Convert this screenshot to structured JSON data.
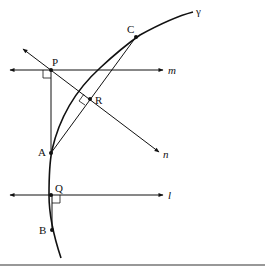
{
  "diagram": {
    "type": "geometry-figure",
    "curve": {
      "name": "gamma",
      "label": "γ"
    },
    "points": [
      {
        "id": "P",
        "label": "P",
        "x": 51,
        "y": 70
      },
      {
        "id": "C",
        "label": "C",
        "x": 136,
        "y": 37
      },
      {
        "id": "R",
        "label": "R",
        "x": 90,
        "y": 99
      },
      {
        "id": "A",
        "label": "A",
        "x": 51,
        "y": 153
      },
      {
        "id": "Q",
        "label": "Q",
        "x": 51,
        "y": 195
      },
      {
        "id": "B",
        "label": "B",
        "x": 52,
        "y": 230
      }
    ],
    "lines": [
      {
        "id": "m",
        "label": "m",
        "description": "horizontal line through P"
      },
      {
        "id": "l",
        "label": "l",
        "description": "horizontal line through Q"
      },
      {
        "id": "n",
        "label": "n",
        "description": "line through P and R perpendicular to AC"
      }
    ],
    "segments": [
      "PA",
      "AC",
      "QB"
    ],
    "right_angles": [
      "at P between PA and m",
      "at R between n and AC",
      "at Q between QB and l"
    ]
  },
  "labels": {
    "P": "P",
    "C": "C",
    "R": "R",
    "A": "A",
    "Q": "Q",
    "B": "B",
    "m": "m",
    "l": "l",
    "n": "n",
    "gamma": "γ"
  }
}
